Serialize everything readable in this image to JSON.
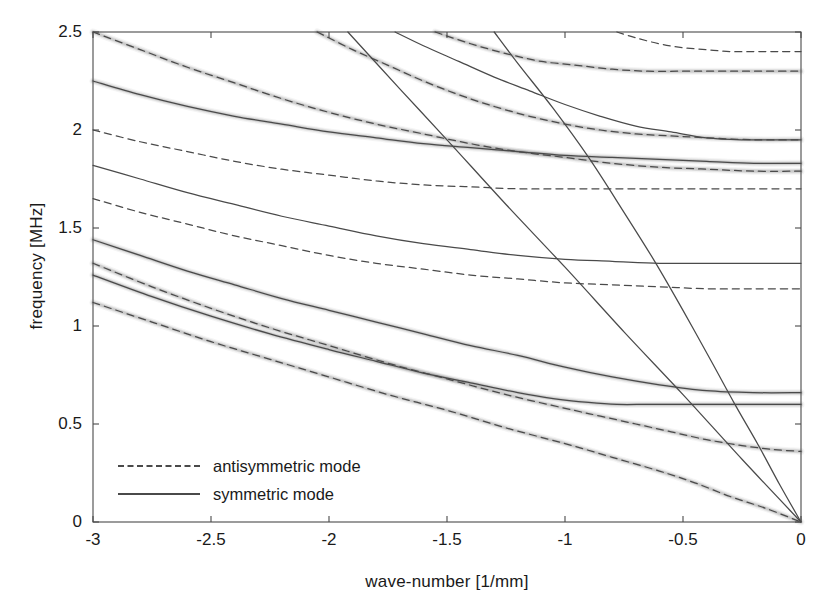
{
  "chart_data": {
    "type": "line",
    "title": "",
    "xlabel": "wave-number [1/mm]",
    "ylabel": "frequency [MHz]",
    "xlim": [
      -3,
      0
    ],
    "ylim": [
      0,
      2.5
    ],
    "xticks": [
      "-3",
      "-2.5",
      "-2",
      "-1.5",
      "-1",
      "-0.5",
      "0"
    ],
    "xtick_values": [
      -3,
      -2.5,
      -2,
      -1.5,
      -1,
      -0.5,
      0
    ],
    "yticks": [
      "0",
      "0.5",
      "1",
      "1.5",
      "2",
      "2.5"
    ],
    "ytick_values": [
      0,
      0.5,
      1,
      1.5,
      2,
      2.5
    ],
    "grid": false,
    "legend_position": "lower-left-inside",
    "legend": [
      {
        "label": "antisymmetric mode",
        "style": "dashed"
      },
      {
        "label": "symmetric mode",
        "style": "solid"
      }
    ],
    "background_data": "diffuse grayscale experimental intensity bands overlaying the lower dispersion branches",
    "series": [
      {
        "name": "A4",
        "style": "dashed",
        "points": [
          [
            -3.0,
            2.5
          ],
          [
            -2.8,
            2.41
          ],
          [
            -2.6,
            2.32
          ],
          [
            -2.4,
            2.24
          ],
          [
            -2.2,
            2.16
          ],
          [
            -2.0,
            2.09
          ],
          [
            -1.8,
            2.03
          ],
          [
            -1.6,
            1.98
          ],
          [
            -1.4,
            1.93
          ],
          [
            -1.2,
            1.89
          ],
          [
            -1.0,
            1.86
          ],
          [
            -0.8,
            1.83
          ],
          [
            -0.6,
            1.81
          ],
          [
            -0.4,
            1.8
          ],
          [
            -0.2,
            1.79
          ],
          [
            0.0,
            1.79
          ]
        ]
      },
      {
        "name": "S4",
        "style": "solid",
        "points": [
          [
            -3.0,
            2.25
          ],
          [
            -2.8,
            2.18
          ],
          [
            -2.6,
            2.12
          ],
          [
            -2.4,
            2.07
          ],
          [
            -2.2,
            2.03
          ],
          [
            -2.0,
            1.99
          ],
          [
            -1.8,
            1.96
          ],
          [
            -1.6,
            1.93
          ],
          [
            -1.4,
            1.91
          ],
          [
            -1.2,
            1.89
          ],
          [
            -1.0,
            1.87
          ],
          [
            -0.8,
            1.86
          ],
          [
            -0.6,
            1.85
          ],
          [
            -0.4,
            1.84
          ],
          [
            -0.2,
            1.83
          ],
          [
            0.0,
            1.83
          ]
        ]
      },
      {
        "name": "A3",
        "style": "dashed",
        "points": [
          [
            -3.0,
            2.0
          ],
          [
            -2.8,
            1.94
          ],
          [
            -2.6,
            1.89
          ],
          [
            -2.4,
            1.84
          ],
          [
            -2.2,
            1.8
          ],
          [
            -2.0,
            1.77
          ],
          [
            -1.8,
            1.74
          ],
          [
            -1.6,
            1.72
          ],
          [
            -1.4,
            1.71
          ],
          [
            -1.2,
            1.7
          ],
          [
            -1.0,
            1.7
          ],
          [
            -0.8,
            1.7
          ],
          [
            -0.6,
            1.7
          ],
          [
            -0.4,
            1.7
          ],
          [
            -0.2,
            1.7
          ],
          [
            0.0,
            1.7
          ]
        ]
      },
      {
        "name": "S3",
        "style": "solid",
        "points": [
          [
            -3.0,
            1.82
          ],
          [
            -2.8,
            1.75
          ],
          [
            -2.6,
            1.68
          ],
          [
            -2.4,
            1.62
          ],
          [
            -2.2,
            1.56
          ],
          [
            -2.0,
            1.51
          ],
          [
            -1.8,
            1.46
          ],
          [
            -1.6,
            1.42
          ],
          [
            -1.4,
            1.39
          ],
          [
            -1.2,
            1.36
          ],
          [
            -1.0,
            1.34
          ],
          [
            -0.8,
            1.33
          ],
          [
            -0.6,
            1.32
          ],
          [
            -0.4,
            1.32
          ],
          [
            -0.2,
            1.32
          ],
          [
            0.0,
            1.32
          ]
        ]
      },
      {
        "name": "A2",
        "style": "dashed",
        "points": [
          [
            -3.0,
            1.65
          ],
          [
            -2.8,
            1.58
          ],
          [
            -2.6,
            1.52
          ],
          [
            -2.4,
            1.46
          ],
          [
            -2.2,
            1.41
          ],
          [
            -2.0,
            1.36
          ],
          [
            -1.8,
            1.32
          ],
          [
            -1.6,
            1.29
          ],
          [
            -1.4,
            1.26
          ],
          [
            -1.2,
            1.24
          ],
          [
            -1.0,
            1.22
          ],
          [
            -0.8,
            1.21
          ],
          [
            -0.6,
            1.2
          ],
          [
            -0.4,
            1.19
          ],
          [
            -0.2,
            1.19
          ],
          [
            0.0,
            1.19
          ]
        ]
      },
      {
        "name": "S2",
        "style": "solid",
        "points": [
          [
            -3.0,
            1.44
          ],
          [
            -2.8,
            1.36
          ],
          [
            -2.6,
            1.28
          ],
          [
            -2.4,
            1.21
          ],
          [
            -2.2,
            1.14
          ],
          [
            -2.0,
            1.08
          ],
          [
            -1.8,
            1.02
          ],
          [
            -1.6,
            0.96
          ],
          [
            -1.4,
            0.9
          ],
          [
            -1.2,
            0.85
          ],
          [
            -1.0,
            0.79
          ],
          [
            -0.8,
            0.74
          ],
          [
            -0.6,
            0.7
          ],
          [
            -0.4,
            0.67
          ],
          [
            -0.2,
            0.66
          ],
          [
            0.0,
            0.66
          ]
        ]
      },
      {
        "name": "A1-upper",
        "style": "dashed",
        "points": [
          [
            -2.05,
            2.5
          ],
          [
            -1.9,
            2.41
          ],
          [
            -1.75,
            2.33
          ],
          [
            -1.6,
            2.25
          ],
          [
            -1.45,
            2.18
          ],
          [
            -1.3,
            2.12
          ],
          [
            -1.15,
            2.07
          ],
          [
            -1.0,
            2.03
          ],
          [
            -0.85,
            2.0
          ],
          [
            -0.7,
            1.98
          ],
          [
            -0.55,
            1.97
          ],
          [
            -0.4,
            1.96
          ],
          [
            -0.2,
            1.95
          ],
          [
            0.0,
            1.95
          ]
        ]
      },
      {
        "name": "A1-top-branch",
        "style": "dashed",
        "points": [
          [
            -0.78,
            2.5
          ],
          [
            -0.7,
            2.47
          ],
          [
            -0.6,
            2.44
          ],
          [
            -0.5,
            2.42
          ],
          [
            -0.4,
            2.41
          ],
          [
            -0.3,
            2.4
          ],
          [
            -0.2,
            2.4
          ],
          [
            -0.1,
            2.4
          ],
          [
            0.0,
            2.4
          ]
        ]
      },
      {
        "name": "A1-second-top",
        "style": "dashed",
        "points": [
          [
            -1.55,
            2.5
          ],
          [
            -1.4,
            2.44
          ],
          [
            -1.25,
            2.39
          ],
          [
            -1.1,
            2.35
          ],
          [
            -0.95,
            2.33
          ],
          [
            -0.8,
            2.31
          ],
          [
            -0.65,
            2.3
          ],
          [
            -0.5,
            2.3
          ],
          [
            -0.35,
            2.3
          ],
          [
            -0.2,
            2.3
          ],
          [
            0.0,
            2.3
          ]
        ]
      },
      {
        "name": "S1-upper",
        "style": "solid",
        "points": [
          [
            -1.72,
            2.5
          ],
          [
            -1.6,
            2.43
          ],
          [
            -1.45,
            2.35
          ],
          [
            -1.3,
            2.27
          ],
          [
            -1.15,
            2.2
          ],
          [
            -1.0,
            2.13
          ],
          [
            -0.85,
            2.07
          ],
          [
            -0.7,
            2.02
          ],
          [
            -0.55,
            1.99
          ],
          [
            -0.4,
            1.96
          ],
          [
            -0.25,
            1.95
          ],
          [
            -0.1,
            1.95
          ],
          [
            0.0,
            1.95
          ]
        ]
      },
      {
        "name": "A1",
        "style": "dashed",
        "points": [
          [
            -3.0,
            1.32
          ],
          [
            -2.75,
            1.2
          ],
          [
            -2.5,
            1.09
          ],
          [
            -2.25,
            0.99
          ],
          [
            -2.0,
            0.9
          ],
          [
            -1.75,
            0.81
          ],
          [
            -1.5,
            0.73
          ],
          [
            -1.25,
            0.65
          ],
          [
            -1.0,
            0.58
          ],
          [
            -0.85,
            0.54
          ],
          [
            -0.7,
            0.5
          ],
          [
            -0.55,
            0.46
          ],
          [
            -0.4,
            0.42
          ],
          [
            -0.25,
            0.39
          ],
          [
            -0.12,
            0.37
          ],
          [
            0.0,
            0.36
          ]
        ]
      },
      {
        "name": "S1",
        "style": "solid",
        "points": [
          [
            -3.0,
            1.26
          ],
          [
            -2.75,
            1.15
          ],
          [
            -2.5,
            1.05
          ],
          [
            -2.25,
            0.96
          ],
          [
            -2.0,
            0.88
          ],
          [
            -1.8,
            0.82
          ],
          [
            -1.6,
            0.76
          ],
          [
            -1.4,
            0.71
          ],
          [
            -1.2,
            0.66
          ],
          [
            -1.05,
            0.63
          ],
          [
            -0.9,
            0.61
          ],
          [
            -0.78,
            0.6
          ],
          [
            -0.65,
            0.6
          ],
          [
            -0.5,
            0.6
          ],
          [
            -0.35,
            0.6
          ],
          [
            -0.18,
            0.6
          ],
          [
            0.0,
            0.6
          ]
        ]
      },
      {
        "name": "S0-linear",
        "style": "solid",
        "points": [
          [
            -1.92,
            2.5
          ],
          [
            -1.7,
            2.21
          ],
          [
            -1.5,
            1.95
          ],
          [
            -1.25,
            1.62
          ],
          [
            -1.0,
            1.3
          ],
          [
            -0.75,
            0.97
          ],
          [
            -0.5,
            0.65
          ],
          [
            -0.25,
            0.32
          ],
          [
            0.0,
            0.0
          ]
        ]
      },
      {
        "name": "A0",
        "style": "dashed",
        "points": [
          [
            -3.0,
            1.12
          ],
          [
            -2.75,
            1.02
          ],
          [
            -2.5,
            0.92
          ],
          [
            -2.25,
            0.83
          ],
          [
            -2.0,
            0.74
          ],
          [
            -1.75,
            0.65
          ],
          [
            -1.5,
            0.57
          ],
          [
            -1.25,
            0.48
          ],
          [
            -1.0,
            0.4
          ],
          [
            -0.8,
            0.33
          ],
          [
            -0.6,
            0.26
          ],
          [
            -0.45,
            0.2
          ],
          [
            -0.3,
            0.13
          ],
          [
            -0.15,
            0.07
          ],
          [
            0.0,
            0.0
          ]
        ]
      },
      {
        "name": "S0",
        "style": "solid",
        "points": [
          [
            -1.3,
            2.5
          ],
          [
            -1.2,
            2.34
          ],
          [
            -1.05,
            2.11
          ],
          [
            -0.9,
            1.86
          ],
          [
            -0.75,
            1.58
          ],
          [
            -0.62,
            1.33
          ],
          [
            -0.5,
            1.08
          ],
          [
            -0.38,
            0.82
          ],
          [
            -0.28,
            0.6
          ],
          [
            -0.18,
            0.39
          ],
          [
            -0.09,
            0.19
          ],
          [
            0.0,
            0.0
          ]
        ]
      }
    ]
  },
  "axes": {
    "frame_color": "#4a4a4a",
    "line_color": "#4a4a4a",
    "data_band_color": "#808080"
  }
}
